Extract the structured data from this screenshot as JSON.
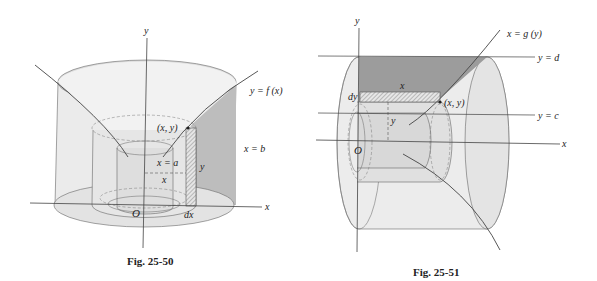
{
  "figures": [
    {
      "id": "fig-25-50",
      "caption": "Fig. 25-50",
      "labels": {
        "y_axis": "y",
        "x_axis": "x",
        "curve": "y = f (x)",
        "point": "(x, y)",
        "x_eq_a": "x = a",
        "x_eq_b": "x = b",
        "height": "y",
        "radius": "x",
        "thickness": "dx",
        "origin": "O"
      }
    },
    {
      "id": "fig-25-51",
      "caption": "Fig. 25-51",
      "labels": {
        "y_axis": "y",
        "x_axis": "x",
        "curve": "x = g (y)",
        "point": "(x, y)",
        "y_eq_d": "y = d",
        "y_eq_c": "y = c",
        "length": "x",
        "radius": "y",
        "thickness": "dy",
        "origin": "O"
      }
    }
  ],
  "colors": {
    "stroke": "#555555",
    "light_fill": "#ebebeb",
    "mid_fill": "#d9d9d9",
    "dark_fill": "#9a9a9a",
    "text": "#222222"
  }
}
